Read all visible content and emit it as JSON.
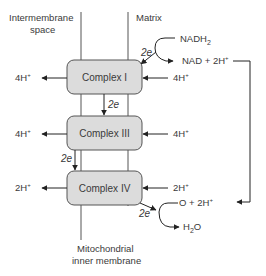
{
  "diagram": {
    "regions": {
      "intermembrane_line1": "Intermembrane",
      "intermembrane_line2": "space",
      "matrix": "Matrix",
      "membrane_line1": "Mitochondrial",
      "membrane_line2": "inner membrane"
    },
    "complexes": [
      {
        "label": "Complex I"
      },
      {
        "label": "Complex III"
      },
      {
        "label": "Complex IV"
      }
    ],
    "proton_labels": {
      "c1_out": "4H",
      "c1_in": "4H",
      "c3_out": "4H",
      "c3_in": "4H",
      "c4_out": "2H",
      "c4_in": "2H",
      "plus": "+"
    },
    "electron_labels": {
      "nadh_to_c1": "2e",
      "c1_to_c3": "2e",
      "c3_to_c4": "2e",
      "c4_to_o": "2e"
    },
    "reactions": {
      "nadh2": "NADH",
      "nadh2_sub": "2",
      "nad_products": "NAD + 2H",
      "oxygen": "O + 2H",
      "water_h": "H",
      "water_sub": "2",
      "water_o": "O"
    },
    "colors": {
      "box_fill": "#dcdcdc",
      "box_stroke": "#555555",
      "line": "#555555",
      "text": "#3a3a3a"
    }
  }
}
